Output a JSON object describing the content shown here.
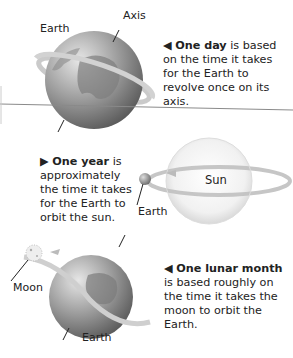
{
  "diagram": {
    "theme": "grayscale",
    "colors": {
      "background": "#ffffff",
      "text": "#222222",
      "globe_light": "#d9d9d9",
      "globe_dark": "#6e6e6e",
      "sun_light": "#fafafa",
      "sun_edge": "#d0d0d0",
      "orbit_ring": "#bdbdbd",
      "divider_line": "#8a8a8a"
    },
    "panel_day": {
      "labels": {
        "earth": "Earth",
        "axis": "Axis"
      },
      "caption": {
        "arrow": "◀",
        "bold": "One day",
        "rest": " is based on the time it takes for the Earth to revolve once on its axis."
      }
    },
    "panel_year": {
      "labels": {
        "sun": "Sun",
        "earth": "Earth"
      },
      "caption": {
        "arrow": "▶",
        "bold": "One year",
        "rest": " is approximately the time it takes for the Earth to orbit the sun."
      }
    },
    "panel_month": {
      "labels": {
        "moon": "Moon",
        "earth": "Earth"
      },
      "caption": {
        "arrow": "◀",
        "bold": "One lunar month",
        "rest": " is based roughly on the time it takes the moon to orbit the Earth."
      }
    }
  }
}
